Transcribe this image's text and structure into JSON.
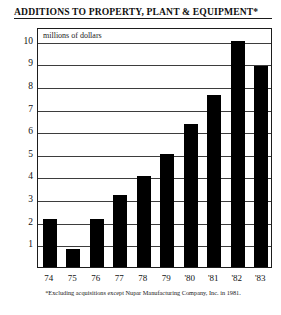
{
  "chart_data": {
    "type": "bar",
    "title": "ADDITIONS TO PROPERTY, PLANT & EQUIPMENT*",
    "subtitle": "millions of dollars",
    "categories": [
      "74",
      "75",
      "76",
      "77",
      "78",
      "79",
      "'80",
      "'81",
      "'82",
      "'83"
    ],
    "values": [
      2.1,
      0.8,
      2.1,
      3.2,
      4.0,
      5.0,
      6.3,
      7.6,
      10.0,
      8.9
    ],
    "xlabel": "",
    "ylabel": "",
    "ylim": [
      0,
      10.6
    ],
    "yticks": [
      1,
      2,
      3,
      4,
      5,
      6,
      7,
      8,
      9,
      10
    ],
    "ytick_labels": [
      "1",
      "2",
      "3",
      "4",
      "5",
      "6",
      "7",
      "8",
      "9",
      "10"
    ],
    "grid": true,
    "legend": false,
    "bar_color": "#000000",
    "footnote": "*Excluding acquisitions except Nupar Manufacturing Company, Inc. in 1981."
  }
}
